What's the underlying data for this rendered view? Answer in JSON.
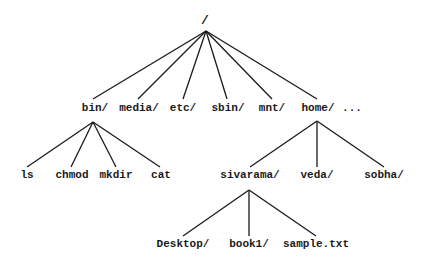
{
  "diagram": {
    "type": "directory-tree",
    "root": {
      "label": "/",
      "x": 205,
      "y": 24
    },
    "edges_color": "#1a1a1a",
    "nodes": [
      {
        "id": "bin",
        "label": "bin/",
        "x": 95,
        "y": 111
      },
      {
        "id": "media",
        "label": "media/",
        "x": 139,
        "y": 111
      },
      {
        "id": "etc",
        "label": "etc/",
        "x": 183,
        "y": 111
      },
      {
        "id": "sbin",
        "label": "sbin/",
        "x": 228,
        "y": 111
      },
      {
        "id": "mnt",
        "label": "mnt/",
        "x": 272,
        "y": 111
      },
      {
        "id": "home",
        "label": "home/",
        "x": 318,
        "y": 111
      },
      {
        "id": "ellipsis",
        "label": "...",
        "x": 352,
        "y": 111
      },
      {
        "id": "ls",
        "label": "ls",
        "x": 27,
        "y": 178
      },
      {
        "id": "chmod",
        "label": "chmod",
        "x": 72,
        "y": 178
      },
      {
        "id": "mkdir",
        "label": "mkdir",
        "x": 116,
        "y": 178
      },
      {
        "id": "cat",
        "label": "cat",
        "x": 161,
        "y": 178
      },
      {
        "id": "sivarama",
        "label": "sivarama/",
        "x": 250,
        "y": 178
      },
      {
        "id": "veda",
        "label": "veda/",
        "x": 317,
        "y": 178
      },
      {
        "id": "sobha",
        "label": "sobha/",
        "x": 384,
        "y": 178
      },
      {
        "id": "desktop",
        "label": "Desktop/",
        "x": 183,
        "y": 247
      },
      {
        "id": "book1",
        "label": "book1/",
        "x": 249,
        "y": 247
      },
      {
        "id": "sample",
        "label": "sample.txt",
        "x": 316,
        "y": 247
      }
    ],
    "edges": [
      {
        "from": "root",
        "to": "bin",
        "x1": 206,
        "y1": 31,
        "x2": 93,
        "y2": 99
      },
      {
        "from": "root",
        "to": "media",
        "x1": 206,
        "y1": 31,
        "x2": 138,
        "y2": 99
      },
      {
        "from": "root",
        "to": "etc",
        "x1": 206,
        "y1": 31,
        "x2": 183,
        "y2": 99
      },
      {
        "from": "root",
        "to": "sbin",
        "x1": 206,
        "y1": 31,
        "x2": 227,
        "y2": 99
      },
      {
        "from": "root",
        "to": "mnt",
        "x1": 206,
        "y1": 31,
        "x2": 272,
        "y2": 99
      },
      {
        "from": "root",
        "to": "home",
        "x1": 206,
        "y1": 31,
        "x2": 317,
        "y2": 99
      },
      {
        "from": "bin",
        "to": "ls",
        "x1": 93,
        "y1": 122,
        "x2": 27,
        "y2": 167
      },
      {
        "from": "bin",
        "to": "chmod",
        "x1": 93,
        "y1": 122,
        "x2": 71,
        "y2": 167
      },
      {
        "from": "bin",
        "to": "mkdir",
        "x1": 93,
        "y1": 122,
        "x2": 116,
        "y2": 167
      },
      {
        "from": "bin",
        "to": "cat",
        "x1": 93,
        "y1": 122,
        "x2": 160,
        "y2": 167
      },
      {
        "from": "home",
        "to": "sivarama",
        "x1": 317,
        "y1": 121,
        "x2": 250,
        "y2": 167
      },
      {
        "from": "home",
        "to": "veda",
        "x1": 317,
        "y1": 121,
        "x2": 317,
        "y2": 167
      },
      {
        "from": "home",
        "to": "sobha",
        "x1": 317,
        "y1": 121,
        "x2": 384,
        "y2": 167
      },
      {
        "from": "sivarama",
        "to": "desktop",
        "x1": 249,
        "y1": 190,
        "x2": 183,
        "y2": 236
      },
      {
        "from": "sivarama",
        "to": "book1",
        "x1": 249,
        "y1": 190,
        "x2": 249,
        "y2": 236
      },
      {
        "from": "sivarama",
        "to": "sample",
        "x1": 249,
        "y1": 190,
        "x2": 316,
        "y2": 236
      }
    ]
  }
}
